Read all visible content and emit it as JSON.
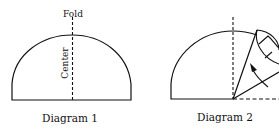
{
  "diagram1": {
    "caption": "Diagram 1",
    "fold_label": "Fold",
    "center_label": "Center"
  },
  "diagram2": {
    "caption": "Diagram 2"
  },
  "colors": {
    "stroke": "#111111",
    "background": "#ffffff"
  }
}
